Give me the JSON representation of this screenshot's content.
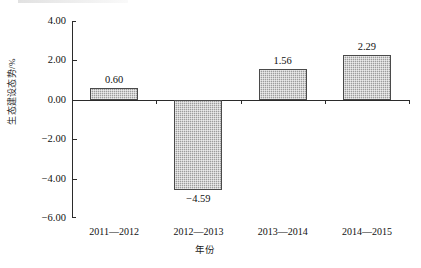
{
  "chart_data": {
    "type": "bar",
    "title": "",
    "xlabel": "年份",
    "ylabel": "生态建设态势/%",
    "categories": [
      "2011—2012",
      "2012—2013",
      "2013—2014",
      "2014—2015"
    ],
    "values": [
      0.6,
      -4.59,
      1.56,
      2.29
    ],
    "value_labels": [
      "0.60",
      "-4.59",
      "1.56",
      "2.29"
    ],
    "ylim": [
      -6.0,
      4.0
    ],
    "yticks": [
      4.0,
      2.0,
      0.0,
      -2.0,
      -4.0,
      -6.0
    ],
    "ytick_labels": [
      "4.00",
      "2.00",
      "0.00",
      "-2.00",
      "-4.00",
      "-6.00"
    ],
    "grid": false,
    "legend": false,
    "series": [
      {
        "name": "生态建设态势",
        "values": [
          0.6,
          -4.59,
          1.56,
          2.29
        ]
      }
    ],
    "colors": {
      "bar_fill": "#9c9c9c",
      "bar_border": "#4a4a4a",
      "axis": "#2b2b2b",
      "text": "#111111",
      "background": "#ffffff"
    }
  }
}
